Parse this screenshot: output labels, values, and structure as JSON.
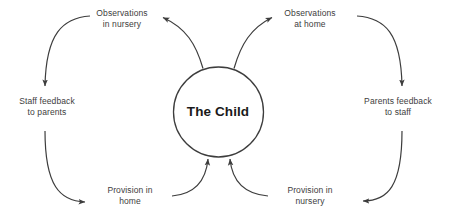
{
  "diagram": {
    "type": "cycle",
    "center": {
      "label": "The Child",
      "shape": "circle"
    },
    "nodes": [
      {
        "id": "observations-in-nursery",
        "label": "Observations\nin nursery",
        "position": "top-left"
      },
      {
        "id": "observations-at-home",
        "label": "Observations\nat home",
        "position": "top-right"
      },
      {
        "id": "staff-feedback-to-parents",
        "label": "Staff feedback\nto parents",
        "position": "left"
      },
      {
        "id": "parents-feedback-to-staff",
        "label": "Parents feedback\nto staff",
        "position": "right"
      },
      {
        "id": "provision-in-home",
        "label": "Provision in\nhome",
        "position": "bottom-left"
      },
      {
        "id": "provision-in-nursery",
        "label": "Provision in\nnursery",
        "position": "bottom-right"
      }
    ],
    "edges": [
      {
        "from": "the-child",
        "to": "observations-in-nursery",
        "direction": "left"
      },
      {
        "from": "the-child",
        "to": "observations-at-home",
        "direction": "right"
      },
      {
        "from": "observations-in-nursery",
        "to": "staff-feedback-to-parents",
        "direction": "down"
      },
      {
        "from": "observations-at-home",
        "to": "parents-feedback-to-staff",
        "direction": "down"
      },
      {
        "from": "staff-feedback-to-parents",
        "to": "provision-in-home",
        "direction": "right"
      },
      {
        "from": "parents-feedback-to-staff",
        "to": "provision-in-nursery",
        "direction": "left"
      },
      {
        "from": "provision-in-home",
        "to": "the-child",
        "direction": "up"
      },
      {
        "from": "provision-in-nursery",
        "to": "the-child",
        "direction": "up"
      }
    ],
    "colors": {
      "stroke": "#3d3d3d",
      "center_text": "#1a1a1a",
      "label_text": "#3d3d3d",
      "background": "#ffffff"
    }
  }
}
